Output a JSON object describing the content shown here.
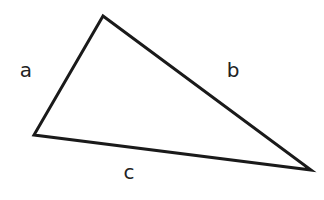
{
  "diagram": {
    "type": "triangle",
    "stroke_color": "#1a1a1a",
    "stroke_width": 3,
    "background": "#ffffff",
    "vertices": {
      "top": [
        103,
        16
      ],
      "left": [
        34,
        135
      ],
      "right": [
        311,
        170
      ]
    },
    "sides": [
      {
        "label": "a",
        "from": "left",
        "to": "top",
        "label_pos": [
          26,
          77
        ]
      },
      {
        "label": "b",
        "from": "top",
        "to": "right",
        "label_pos": [
          233,
          77
        ]
      },
      {
        "label": "c",
        "from": "left",
        "to": "right",
        "label_pos": [
          129,
          179
        ]
      }
    ]
  }
}
